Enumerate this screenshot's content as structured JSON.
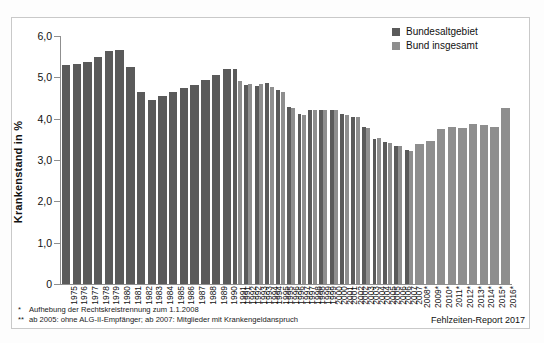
{
  "chart_data": {
    "type": "bar",
    "title": "",
    "xlabel": "",
    "ylabel": "Krankenstand in %",
    "ylim": [
      0,
      6.0
    ],
    "yticks": [
      "0",
      "1,0",
      "2,0",
      "3,0",
      "4,0",
      "5,0",
      "6,0"
    ],
    "ytick_values": [
      0,
      1.0,
      2.0,
      3.0,
      4.0,
      5.0,
      6.0
    ],
    "grid": false,
    "legend_position": "top-right",
    "categories": [
      "1975",
      "1976",
      "1977",
      "1978",
      "1979",
      "1980",
      "1981",
      "1982",
      "1983",
      "1984",
      "1985",
      "1986",
      "1987",
      "1988",
      "1989",
      "1990",
      "1991",
      "1992",
      "1993",
      "1994",
      "1995",
      "1996",
      "1997",
      "1998",
      "1999",
      "2000",
      "2001",
      "2002",
      "2003",
      "2004",
      "2005",
      "2006",
      "2007",
      "2008*",
      "2009*",
      "2010*",
      "2011*",
      "2012*",
      "2013*",
      "2014*",
      "2015*",
      "2016*"
    ],
    "series": [
      {
        "name": "Bundesaltgebiet",
        "color": "#5a5a5a",
        "values": [
          5.29,
          5.32,
          5.38,
          5.49,
          5.63,
          5.65,
          5.26,
          4.64,
          4.44,
          4.54,
          4.65,
          4.75,
          4.82,
          4.93,
          5.06,
          5.19,
          5.21,
          4.81,
          4.78,
          4.86,
          4.69,
          4.29,
          4.11,
          4.21,
          4.21,
          4.22,
          4.12,
          4.04,
          3.8,
          3.52,
          3.44,
          3.35,
          3.24,
          null,
          null,
          null,
          null,
          null,
          null,
          null,
          null,
          null
        ]
      },
      {
        "name": "Bund insgesamt",
        "color": "#8e8e8e",
        "values": [
          null,
          null,
          null,
          null,
          null,
          null,
          null,
          null,
          null,
          null,
          null,
          null,
          null,
          null,
          null,
          null,
          4.9,
          4.85,
          4.83,
          4.76,
          4.64,
          4.26,
          4.1,
          4.2,
          4.22,
          4.2,
          4.1,
          4.03,
          3.78,
          3.53,
          3.42,
          3.33,
          3.22,
          3.39,
          3.45,
          3.75,
          3.81,
          3.78,
          3.88,
          3.85,
          3.79,
          4.26
        ]
      }
    ]
  },
  "legend": {
    "items": [
      {
        "label": "Bundesaltgebiet",
        "color": "#5a5a5a"
      },
      {
        "label": "Bund insgesamt",
        "color": "#8e8e8e"
      }
    ]
  },
  "footnotes": [
    {
      "marker": "*",
      "text": "Aufhebung der Rechtskreistrennung zum 1.1.2008"
    },
    {
      "marker": "**",
      "text": "ab 2005: ohne ALG-II-Empfänger; ab 2007: Mitglieder mit Krankengeldanspruch"
    }
  ],
  "source": "Fehlzeiten-Report 2017"
}
